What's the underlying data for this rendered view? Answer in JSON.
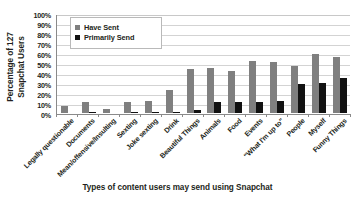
{
  "chart_data": {
    "type": "bar",
    "title": "",
    "xlabel": "Types of content users may send using Snapchat",
    "ylabel": "Percentage of 127 Snapchat Users",
    "ylabel_lines": [
      "Percentage of 127",
      "Snapchat Users"
    ],
    "ylim": [
      0,
      100
    ],
    "yticks": [
      "100%",
      "90%",
      "80%",
      "70%",
      "60%",
      "50%",
      "40%",
      "30%",
      "20%",
      "10%",
      "0%"
    ],
    "ytick_values": [
      100,
      90,
      80,
      70,
      60,
      50,
      40,
      30,
      20,
      10,
      0
    ],
    "grid": true,
    "legend_position": "top-left",
    "categories": [
      "Legally questionable",
      "Documents",
      "Mean/offensive/Insulting",
      "Sexting",
      "Joke sexting",
      "Drink",
      "Beautiful Things",
      "Animals",
      "Food",
      "Events",
      "\"What I'm up to\"",
      "People",
      "Myself",
      "Funny Things"
    ],
    "series": [
      {
        "name": "Have Sent",
        "color": "#7f7f7f",
        "values": [
          7,
          11,
          4,
          11,
          12,
          23,
          44,
          45,
          42,
          52,
          51,
          47,
          59,
          56
        ]
      },
      {
        "name": "Primarily Send",
        "color": "#121212",
        "values": [
          0,
          1,
          0,
          1,
          1,
          1,
          3,
          11,
          11,
          11,
          12,
          29,
          30,
          35
        ]
      }
    ]
  },
  "legend": {
    "items": [
      {
        "label": "Have Sent",
        "color": "#7f7f7f"
      },
      {
        "label": "Primarily Send",
        "color": "#121212"
      }
    ]
  }
}
